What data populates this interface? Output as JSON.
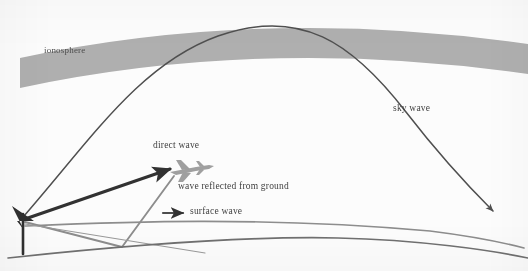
{
  "figure": {
    "labels": {
      "ionosphere": "ionosphere",
      "sky_wave": "sky wave",
      "direct_wave": "direct wave",
      "reflected_wave": "wave reflected from ground",
      "surface_wave": "surface wave"
    },
    "colors": {
      "ionosphere_band": "#a8a8a8",
      "sky_wave_line": "#4c4c4c",
      "direct_wave_line": "#2e2e2e",
      "reflected_wave_line": "#8c8c8c",
      "surface_wave_line": "#8c8c8c",
      "ground_line": "#6e6e6e",
      "antenna": "#2b2b2b",
      "airplane": "#9a9a9a",
      "label_text": "#3b3b3b",
      "background": "#ffffff"
    },
    "elements": {
      "antenna": "transmitting antenna mast at left",
      "airplane": "aircraft receiving the direct wave",
      "ground": "curved earth surface",
      "surface_wave_arrow": "short right-pointing arrow marker"
    }
  }
}
